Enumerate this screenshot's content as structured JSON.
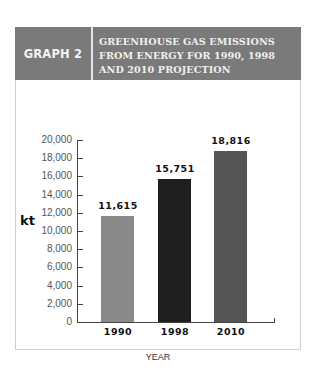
{
  "header": {
    "label": "GRAPH 2",
    "title": "GREENHOUSE GAS EMISSIONS FROM ENERGY FOR 1990, 1998 AND 2010 PROJECTION"
  },
  "colors": {
    "header_bg": "#7a7a7a",
    "bar_1990": "#8a8a8a",
    "bar_1998": "#1e1e1e",
    "bar_2010": "#555555"
  },
  "chart_data": {
    "type": "bar",
    "title": "GREENHOUSE GAS EMISSIONS FROM ENERGY FOR 1990, 1998 AND 2010 PROJECTION",
    "categories": [
      "1990",
      "1998",
      "2010"
    ],
    "values": [
      11615,
      15751,
      18816
    ],
    "value_labels": [
      "11,615",
      "15,751",
      "18,816"
    ],
    "xlabel": "YEAR",
    "ylabel": "kt",
    "ylim": [
      0,
      20000
    ],
    "yticks": [
      "0",
      "2,000",
      "4,000",
      "6,000",
      "8,000",
      "10,000",
      "12,000",
      "14,000",
      "16,000",
      "18,000",
      "20,000"
    ],
    "grid": false,
    "legend": null
  }
}
